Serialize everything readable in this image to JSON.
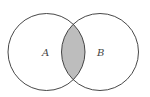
{
  "diagram": {
    "type": "venn",
    "sets": [
      {
        "label": "A",
        "cx": 46.5,
        "cy": 52,
        "r": 38.5
      },
      {
        "label": "B",
        "cx": 100,
        "cy": 52,
        "r": 38.5
      }
    ],
    "highlighted_region": "A ∩ B",
    "colors": {
      "stroke": "#333333",
      "intersection_fill": "#bdbdbd",
      "background": "#ffffff"
    }
  }
}
